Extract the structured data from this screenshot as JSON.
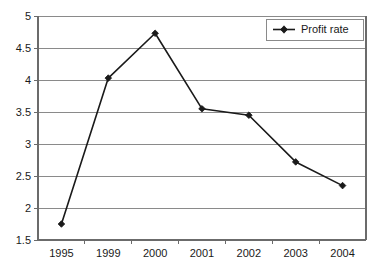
{
  "chart_data": {
    "type": "line",
    "title": "",
    "subtitle": "",
    "xlabel": "",
    "ylabel": "",
    "categories": [
      "1995",
      "1999",
      "2000",
      "2001",
      "2002",
      "2003",
      "2004"
    ],
    "series": [
      {
        "name": "Profit rate",
        "values": [
          1.75,
          4.03,
          4.73,
          3.55,
          3.45,
          2.72,
          2.35
        ],
        "color": "#1a1a1a",
        "marker": "diamond"
      }
    ],
    "ylim": [
      1.5,
      5
    ],
    "y_ticks": [
      "1.5",
      "2",
      "2.5",
      "3",
      "3.5",
      "4",
      "4.5",
      "5"
    ],
    "y_tick_values": [
      1.5,
      2,
      2.5,
      3,
      3.5,
      4,
      4.5,
      5
    ],
    "x_ticks": [
      "1995",
      "1999",
      "2000",
      "2001",
      "2002",
      "2003",
      "2004"
    ],
    "grid": true,
    "grid_axis": "y",
    "legend": {
      "position": "top-right",
      "entries": [
        "Profit rate"
      ]
    },
    "annotations": []
  },
  "legend": {
    "entry_label": "Profit rate"
  },
  "axes": {
    "y_labels": [
      "5",
      "4.5",
      "4",
      "3.5",
      "3",
      "2.5",
      "2",
      "1.5"
    ],
    "x_labels": [
      "1995",
      "1999",
      "2000",
      "2001",
      "2002",
      "2003",
      "2004"
    ]
  }
}
